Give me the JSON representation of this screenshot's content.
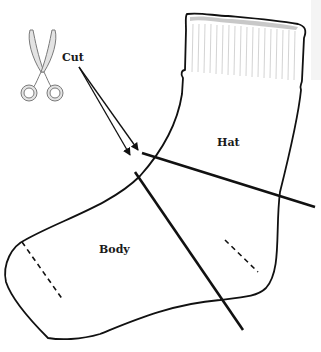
{
  "diagram": {
    "labels": {
      "cut": "Cut",
      "hat": "Hat",
      "body": "Body"
    },
    "icons": {
      "scissors": "scissors-icon"
    },
    "colors": {
      "outline": "#111111",
      "scissors_fill": "#e3e3e3",
      "scissors_stroke": "#7a7a7a",
      "cuff_ribbing": "#c8c8c8",
      "background": "#ffffff"
    },
    "elements": [
      {
        "name": "sock-outline",
        "type": "shape"
      },
      {
        "name": "cuff-ribbing",
        "type": "pattern"
      },
      {
        "name": "hat-cut-line",
        "type": "line",
        "from": [
          142,
          153
        ],
        "to": [
          315,
          207
        ]
      },
      {
        "name": "body-cut-line",
        "type": "line",
        "from": [
          135,
          172
        ],
        "to": [
          243,
          330
        ]
      },
      {
        "name": "cut-arrow-1",
        "type": "arrow",
        "from": [
          79,
          67
        ],
        "to": [
          130,
          155
        ]
      },
      {
        "name": "cut-arrow-2",
        "type": "arrow",
        "from": [
          79,
          67
        ],
        "to": [
          138,
          150
        ]
      },
      {
        "name": "toe-seam-dashes",
        "type": "dashed-line"
      },
      {
        "name": "heel-dashes",
        "type": "dashed-line"
      }
    ]
  }
}
